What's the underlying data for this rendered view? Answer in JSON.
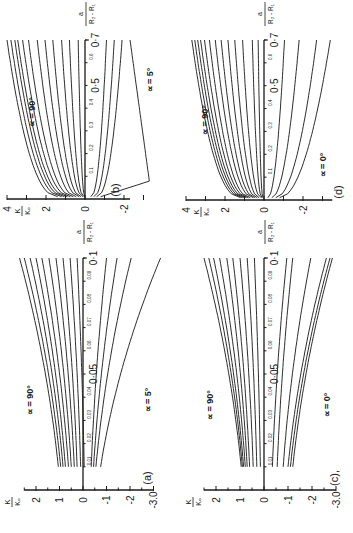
{
  "figure": {
    "orientation": "rotated 90deg counter-clockwise",
    "panels": [
      {
        "id": "a",
        "label": "(a)",
        "alpha_top": "∝ = 90°",
        "alpha_bottom": "∝ = 5°"
      },
      {
        "id": "b",
        "label": "(b)",
        "alpha_top": "∝ = 90°",
        "alpha_bottom": "∝ = 5°"
      },
      {
        "id": "c",
        "label": "(c),",
        "alpha_top": "∝ = 90°",
        "alpha_bottom": "∝ = 0°"
      },
      {
        "id": "d",
        "label": "(d)",
        "alpha_top": "∝ = 90°",
        "alpha_bottom": "∝ = 0°"
      }
    ],
    "ylabel_num": "K",
    "ylabel_den": "Kₒ",
    "xlabel_num": "a",
    "xlabel_den": "R₂ - R₁"
  },
  "chart_data": [
    {
      "panel": "(a)",
      "type": "line",
      "xlabel": "a/(R2-R1)",
      "ylabel": "K/K0",
      "xlim": [
        0,
        0.1
      ],
      "ylim": [
        -3.0,
        2.5
      ],
      "x_tick_labels": [
        "0.01",
        "0.02",
        "0.03",
        "0.04",
        "0.05",
        "0.06",
        "0.07",
        "0.08",
        "0.09",
        "0.1"
      ],
      "y_tick_labels": [
        "2",
        "1",
        "0",
        "-1",
        "-2",
        "-3.0"
      ],
      "annotations": [
        "∝ = 90°",
        "∝ = 5°"
      ],
      "x_start": 0.01,
      "series": [
        {
          "name": "∝=90°",
          "values": [
            1.05,
            2.7
          ]
        },
        {
          "name": "c2",
          "values": [
            0.95,
            2.5
          ]
        },
        {
          "name": "c3",
          "values": [
            0.85,
            2.25
          ]
        },
        {
          "name": "c4",
          "values": [
            0.75,
            2.0
          ]
        },
        {
          "name": "c5",
          "values": [
            0.62,
            1.75
          ]
        },
        {
          "name": "c6",
          "values": [
            0.5,
            1.45
          ]
        },
        {
          "name": "c7",
          "values": [
            0.37,
            1.15
          ]
        },
        {
          "name": "c8",
          "values": [
            0.25,
            0.85
          ]
        },
        {
          "name": "c9",
          "values": [
            0.1,
            0.55
          ]
        },
        {
          "name": "c10",
          "values": [
            -0.05,
            0.25
          ]
        },
        {
          "name": "c11",
          "values": [
            -0.35,
            -1.0
          ]
        },
        {
          "name": "c12",
          "values": [
            -0.45,
            -1.45
          ]
        },
        {
          "name": "c13",
          "values": [
            -0.55,
            -2.05
          ]
        },
        {
          "name": "∝=5°",
          "values": [
            -0.75,
            -3.3
          ]
        }
      ]
    },
    {
      "panel": "(b)",
      "type": "line",
      "xlabel": "a/(R2-R1)",
      "ylabel": "K/K0",
      "xlim": [
        0,
        0.7
      ],
      "ylim": [
        -3.5,
        4
      ],
      "x_tick_labels": [
        "0.1",
        "0.2",
        "0.3",
        "0.4",
        "0.5",
        "0.6",
        "0.7"
      ],
      "y_tick_labels": [
        "4",
        "2",
        "0",
        "-2"
      ],
      "annotations": [
        "∝ = 90°",
        "∝ = 5°"
      ],
      "x_start": 0.01,
      "series": [
        {
          "name": "∝=90°",
          "values": [
            1.4,
            4.0
          ]
        },
        {
          "name": "c2",
          "values": [
            1.2,
            3.8
          ]
        },
        {
          "name": "c3",
          "values": [
            1.05,
            3.6
          ]
        },
        {
          "name": "c4",
          "values": [
            0.9,
            3.45
          ]
        },
        {
          "name": "c5",
          "values": [
            0.75,
            3.2
          ]
        },
        {
          "name": "c6",
          "values": [
            0.6,
            2.9
          ]
        },
        {
          "name": "c7",
          "values": [
            0.45,
            2.45
          ]
        },
        {
          "name": "c8",
          "values": [
            0.3,
            2.05
          ]
        },
        {
          "name": "c9",
          "values": [
            0.2,
            1.65
          ]
        },
        {
          "name": "c10",
          "values": [
            0.1,
            1.2
          ]
        },
        {
          "name": "c11",
          "values": [
            0.05,
            0.8
          ]
        },
        {
          "name": "c12",
          "values": [
            0.0,
            0.35
          ]
        },
        {
          "name": "c13",
          "values": [
            -0.3,
            -1.1
          ]
        },
        {
          "name": "c14",
          "values": [
            -0.45,
            -1.5
          ]
        },
        {
          "name": "c15",
          "values": [
            -0.6,
            -1.9
          ]
        },
        {
          "name": "∝=5°",
          "values": [
            -0.8,
            -2.2
          ]
        }
      ]
    },
    {
      "panel": "(c)",
      "type": "line",
      "xlabel": "a/(R2-R1)",
      "ylabel": "K/K0",
      "xlim": [
        0,
        0.1
      ],
      "ylim": [
        -3.0,
        2.5
      ],
      "x_tick_labels": [
        "0.01",
        "0.02",
        "0.03",
        "0.04",
        "0.05",
        "0.06",
        "0.07",
        "0.08",
        "0.09",
        "0.1"
      ],
      "y_tick_labels": [
        "2",
        "1",
        "0",
        "-1",
        "-2",
        "-3.0"
      ],
      "annotations": [
        "∝ = 90°",
        "∝ = 0°"
      ],
      "x_start": 0.01,
      "series": [
        {
          "name": "∝=90°",
          "values": [
            0.95,
            2.5
          ]
        },
        {
          "name": "c2",
          "values": [
            0.9,
            2.3
          ]
        },
        {
          "name": "c3",
          "values": [
            0.85,
            2.1
          ]
        },
        {
          "name": "c4",
          "values": [
            0.78,
            1.85
          ]
        },
        {
          "name": "c5",
          "values": [
            0.7,
            1.55
          ]
        },
        {
          "name": "c6",
          "values": [
            0.6,
            1.3
          ]
        },
        {
          "name": "c7",
          "values": [
            0.45,
            1.0
          ]
        },
        {
          "name": "c8",
          "values": [
            0.3,
            0.7
          ]
        },
        {
          "name": "c9",
          "values": [
            0.15,
            0.4
          ]
        },
        {
          "name": "c10",
          "values": [
            -0.35,
            -0.95
          ]
        },
        {
          "name": "c11",
          "values": [
            -0.55,
            -1.2
          ]
        },
        {
          "name": "c12",
          "values": [
            -0.8,
            -1.95
          ]
        },
        {
          "name": "c13",
          "values": [
            -1.0,
            -2.6
          ]
        },
        {
          "name": "c14",
          "values": [
            -1.1,
            -2.75
          ]
        },
        {
          "name": "∝=0°",
          "values": [
            -1.2,
            -2.85
          ]
        }
      ]
    },
    {
      "panel": "(d)",
      "type": "line",
      "xlabel": "a/(R2-R1)",
      "ylabel": "K/K0",
      "xlim": [
        0,
        0.7
      ],
      "ylim": [
        -3.5,
        4
      ],
      "x_tick_labels": [
        "0.1",
        "0.2",
        "0.3",
        "0.4",
        "0.5",
        "0.6",
        "0.7"
      ],
      "y_tick_labels": [
        "4",
        "2",
        "0",
        "-2"
      ],
      "annotations": [
        "∝ = 90°",
        "∝ = 0°"
      ],
      "x_start": 0.01,
      "series": [
        {
          "name": "∝=90°",
          "values": [
            1.2,
            3.7
          ]
        },
        {
          "name": "c2",
          "values": [
            1.1,
            3.55
          ]
        },
        {
          "name": "c3",
          "values": [
            1.0,
            3.4
          ]
        },
        {
          "name": "c4",
          "values": [
            0.9,
            3.25
          ]
        },
        {
          "name": "c5",
          "values": [
            0.8,
            3.05
          ]
        },
        {
          "name": "c6",
          "values": [
            0.7,
            2.8
          ]
        },
        {
          "name": "c7",
          "values": [
            0.55,
            2.5
          ]
        },
        {
          "name": "c8",
          "values": [
            0.45,
            2.2
          ]
        },
        {
          "name": "c9",
          "values": [
            0.35,
            1.85
          ]
        },
        {
          "name": "c10",
          "values": [
            0.25,
            1.5
          ]
        },
        {
          "name": "c11",
          "values": [
            0.15,
            1.1
          ]
        },
        {
          "name": "c12",
          "values": [
            0.1,
            0.6
          ]
        },
        {
          "name": "c13",
          "values": [
            0.05,
            0.3
          ]
        },
        {
          "name": "c14",
          "values": [
            -0.2,
            -1.05
          ]
        },
        {
          "name": "c15",
          "values": [
            -0.4,
            -1.8
          ]
        },
        {
          "name": "c16",
          "values": [
            -0.6,
            -2.7
          ]
        },
        {
          "name": "∝=0°",
          "values": [
            -0.8,
            -3.4
          ]
        }
      ]
    }
  ]
}
